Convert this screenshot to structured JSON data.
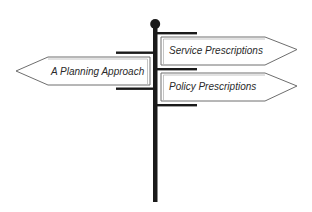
{
  "diagram": {
    "type": "signpost",
    "colors": {
      "pole": "#1a1a1a",
      "sign_border": "#6e6e6e",
      "sign_inner_border": "#b5b5b5",
      "sign_fill": "#ffffff",
      "text": "#2a2a2a"
    },
    "signs": [
      {
        "label": "Service Prescriptions",
        "direction": "right"
      },
      {
        "label": "A Planning Approach",
        "direction": "left"
      },
      {
        "label": "Policy Prescriptions",
        "direction": "right"
      }
    ]
  }
}
